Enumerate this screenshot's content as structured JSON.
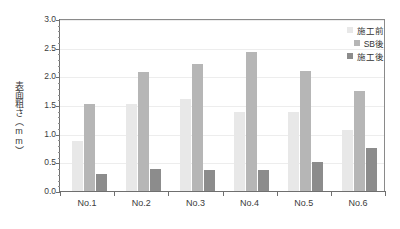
{
  "chart_data": {
    "type": "bar",
    "title": "",
    "xlabel": "",
    "ylabel": "表面粗さ（mm）",
    "ylim": [
      0.0,
      3.0
    ],
    "ytick_step": 0.5,
    "yticks": [
      "0.0",
      "0.5",
      "1.0",
      "1.5",
      "2.0",
      "2.5",
      "3.0"
    ],
    "grid": "horizontal",
    "legend_position": "top-right",
    "categories": [
      "No.1",
      "No.2",
      "No.3",
      "No.4",
      "No.5",
      "No.6"
    ],
    "series": [
      {
        "name": "施工前",
        "color": "#e8e8e8",
        "values": [
          0.88,
          1.51,
          1.6,
          1.38,
          1.38,
          1.06
        ]
      },
      {
        "name": "SB後",
        "color": "#b6b6b6",
        "values": [
          1.52,
          2.08,
          2.21,
          2.42,
          2.1,
          1.74
        ]
      },
      {
        "name": "施工後",
        "color": "#8c8c8c",
        "values": [
          0.3,
          0.38,
          0.37,
          0.36,
          0.5,
          0.75
        ]
      }
    ]
  },
  "axis": {
    "y_title": "表面粗さ（mm）"
  }
}
